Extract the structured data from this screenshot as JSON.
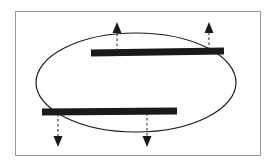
{
  "figure": {
    "title": "Ellipse with two horizontal bars and four directional arrows",
    "caption": "",
    "width": 269,
    "height": 167,
    "background_color": "#ffffff"
  },
  "frame": {
    "name": "figure-border",
    "x": 15.5,
    "y": 11.5,
    "width": 245,
    "height": 144,
    "stroke_color": "#9a9a9a",
    "stroke_width": 1,
    "fill": "none"
  },
  "ellipse": {
    "name": "outline-ellipse",
    "cx": 136,
    "cy": 82.5,
    "rx": 100,
    "ry": 49.5,
    "stroke_color": "#1a1a1a",
    "stroke_width": 1.2,
    "fill": "none"
  },
  "bars": [
    {
      "id": "upper-bar",
      "label": "Upper bar",
      "x1": 91,
      "y1": 53.0,
      "x2": 224,
      "y2": 51.0,
      "thickness": 7,
      "color": "#1a1a1a"
    },
    {
      "id": "lower-bar",
      "label": "Lower bar",
      "x1": 42,
      "y1": 112.0,
      "x2": 177,
      "y2": 111.0,
      "thickness": 7,
      "color": "#1a1a1a"
    }
  ],
  "arrows": [
    {
      "id": "arrow-up-left",
      "label": "Upward arrow (left)",
      "direction": "up",
      "x": 117,
      "tail_y": 51,
      "tip_y": 22,
      "color": "#1a1a1a",
      "stem_style": "dashed",
      "head_width": 9,
      "head_length": 11
    },
    {
      "id": "arrow-up-right",
      "label": "Upward arrow (right)",
      "direction": "up",
      "x": 209,
      "tail_y": 50,
      "tip_y": 22,
      "color": "#1a1a1a",
      "stem_style": "dashed",
      "head_width": 9,
      "head_length": 11
    },
    {
      "id": "arrow-down-left",
      "label": "Downward arrow (left)",
      "direction": "down",
      "x": 58,
      "tail_y": 114,
      "tip_y": 147,
      "color": "#1a1a1a",
      "stem_style": "dashed",
      "head_width": 9,
      "head_length": 11
    },
    {
      "id": "arrow-down-middle",
      "label": "Downward arrow (middle)",
      "direction": "down",
      "x": 147,
      "tail_y": 113,
      "tip_y": 147,
      "color": "#1a1a1a",
      "stem_style": "dashed",
      "head_width": 9,
      "head_length": 11
    }
  ],
  "colors": {
    "ink": "#1a1a1a",
    "frame": "#9a9a9a",
    "background": "#ffffff"
  }
}
